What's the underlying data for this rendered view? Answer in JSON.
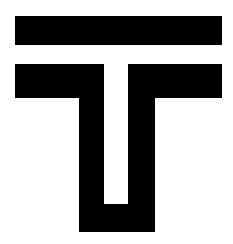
{
  "image": {
    "kind": "logo-glyph",
    "subject": "stylized-letter-t",
    "alt_text": "Stylized letter T logo: a detached horizontal top bar above a T whose vertical stem is split into a U shape",
    "width": 233,
    "height": 244,
    "background_color": "#ffffff",
    "ink_color": "#000000",
    "title": "",
    "caption": ""
  },
  "geometry": {
    "units": "px",
    "viewbox": "0 0 233 244",
    "shapes": [
      {
        "name": "top-bar",
        "type": "rect",
        "x": 15,
        "y": 16,
        "width": 207,
        "height": 29,
        "fill": "#000000"
      },
      {
        "name": "lower-t-with-u-stem",
        "type": "polygon",
        "fill": "#000000",
        "points": "15,64 222,64 222,98 155,98 155,232 79,232 79,98 15,98"
      },
      {
        "name": "inner-notch",
        "type": "polygon",
        "fill": "#ffffff",
        "points": "104,64 128,64 128,204 104,204"
      }
    ]
  },
  "labels": {
    "artboard": "glyph-artboard",
    "shape_group": "glyph-shape-group"
  }
}
